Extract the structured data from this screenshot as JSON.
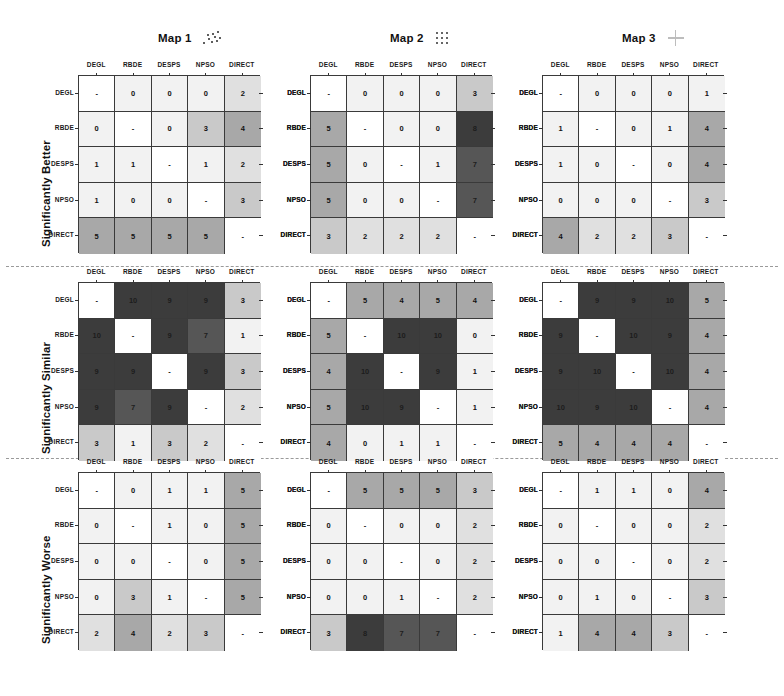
{
  "figure": {
    "labels": [
      "DEGL",
      "RBDE",
      "DESPS",
      "NPSO",
      "DIRECT"
    ],
    "band_labels": [
      "Significantly Better",
      "Significantly Similar",
      "Significantly Worse"
    ],
    "maps": [
      {
        "title": "Map 1",
        "glyph": "scatter-dots-icon"
      },
      {
        "title": "Map 2",
        "glyph": "grid-dots-icon"
      },
      {
        "title": "Map 3",
        "glyph": "cross-icon"
      }
    ],
    "diagonal_marker": "-",
    "colors": {
      "white": "#ffffff",
      "very_light": "#f2f2f2",
      "light": "#e0e0e0",
      "mid_light": "#c9c9c9",
      "mid": "#a8a8a8",
      "mid_dark": "#7d7d7d",
      "dark": "#565656",
      "very_dark": "#3c3c3c",
      "grid_line": "#3a3a3a"
    }
  },
  "chart_data": {
    "type": "heatmap",
    "xlabel": "",
    "ylabel": "",
    "categories": [
      "DEGL",
      "RBDE",
      "DESPS",
      "NPSO",
      "DIRECT"
    ],
    "row_categories": [
      "DEGL",
      "RBDE",
      "DESPS",
      "NPSO",
      "DIRECT"
    ],
    "col_categories": [
      "DEGL",
      "RBDE",
      "DESPS",
      "NPSO",
      "DIRECT"
    ],
    "value_range": [
      0,
      10
    ],
    "grid": true,
    "legend": "none",
    "diagonal": "not-applicable (shown as dash)",
    "panel_rows": [
      "Significantly Better",
      "Significantly Similar",
      "Significantly Worse"
    ],
    "panel_cols": [
      "Map 1",
      "Map 2",
      "Map 3"
    ],
    "panels": [
      {
        "row_band": "Significantly Better",
        "map": "Map 1",
        "matrix": [
          [
            "-",
            "0",
            "0",
            "0",
            "2"
          ],
          [
            "0",
            "-",
            "0",
            "3",
            "4"
          ],
          [
            "1",
            "1",
            "-",
            "1",
            "2"
          ],
          [
            "1",
            "0",
            "0",
            "-",
            "3"
          ],
          [
            "5",
            "5",
            "5",
            "5",
            "-"
          ]
        ]
      },
      {
        "row_band": "Significantly Better",
        "map": "Map 2",
        "matrix": [
          [
            "-",
            "0",
            "0",
            "0",
            "3"
          ],
          [
            "5",
            "-",
            "0",
            "0",
            "8"
          ],
          [
            "5",
            "0",
            "-",
            "1",
            "7"
          ],
          [
            "5",
            "0",
            "0",
            "-",
            "7"
          ],
          [
            "3",
            "2",
            "2",
            "2",
            "-"
          ]
        ]
      },
      {
        "row_band": "Significantly Better",
        "map": "Map 3",
        "matrix": [
          [
            "-",
            "0",
            "0",
            "0",
            "1"
          ],
          [
            "1",
            "-",
            "0",
            "1",
            "4"
          ],
          [
            "1",
            "0",
            "-",
            "0",
            "4"
          ],
          [
            "0",
            "0",
            "0",
            "-",
            "3"
          ],
          [
            "4",
            "2",
            "2",
            "3",
            "-"
          ]
        ]
      },
      {
        "row_band": "Significantly Similar",
        "map": "Map 1",
        "matrix": [
          [
            "-",
            "10",
            "9",
            "9",
            "3"
          ],
          [
            "10",
            "-",
            "9",
            "7",
            "1"
          ],
          [
            "9",
            "9",
            "-",
            "9",
            "3"
          ],
          [
            "9",
            "7",
            "9",
            "-",
            "2"
          ],
          [
            "3",
            "1",
            "3",
            "2",
            "-"
          ]
        ]
      },
      {
        "row_band": "Significantly Similar",
        "map": "Map 2",
        "matrix": [
          [
            "-",
            "5",
            "4",
            "5",
            "4"
          ],
          [
            "5",
            "-",
            "10",
            "10",
            "0"
          ],
          [
            "4",
            "10",
            "-",
            "9",
            "1"
          ],
          [
            "5",
            "10",
            "9",
            "-",
            "1"
          ],
          [
            "4",
            "0",
            "1",
            "1",
            "-"
          ]
        ]
      },
      {
        "row_band": "Significantly Similar",
        "map": "Map 3",
        "matrix": [
          [
            "-",
            "9",
            "9",
            "10",
            "5"
          ],
          [
            "9",
            "-",
            "10",
            "9",
            "4"
          ],
          [
            "9",
            "10",
            "-",
            "10",
            "4"
          ],
          [
            "10",
            "9",
            "10",
            "-",
            "4"
          ],
          [
            "5",
            "4",
            "4",
            "4",
            "-"
          ]
        ]
      },
      {
        "row_band": "Significantly Worse",
        "map": "Map 1",
        "matrix": [
          [
            "-",
            "0",
            "1",
            "1",
            "5"
          ],
          [
            "0",
            "-",
            "1",
            "0",
            "5"
          ],
          [
            "0",
            "0",
            "-",
            "0",
            "5"
          ],
          [
            "0",
            "3",
            "1",
            "-",
            "5"
          ],
          [
            "2",
            "4",
            "2",
            "3",
            "-"
          ]
        ]
      },
      {
        "row_band": "Significantly Worse",
        "map": "Map 2",
        "matrix": [
          [
            "-",
            "5",
            "5",
            "5",
            "3"
          ],
          [
            "0",
            "-",
            "0",
            "0",
            "2"
          ],
          [
            "0",
            "0",
            "-",
            "0",
            "2"
          ],
          [
            "0",
            "0",
            "1",
            "-",
            "2"
          ],
          [
            "3",
            "8",
            "7",
            "7",
            "-"
          ]
        ]
      },
      {
        "row_band": "Significantly Worse",
        "map": "Map 3",
        "matrix": [
          [
            "-",
            "1",
            "1",
            "0",
            "4"
          ],
          [
            "0",
            "-",
            "0",
            "0",
            "2"
          ],
          [
            "0",
            "0",
            "-",
            "0",
            "2"
          ],
          [
            "0",
            "1",
            "0",
            "-",
            "3"
          ],
          [
            "1",
            "4",
            "4",
            "3",
            "-"
          ]
        ]
      }
    ]
  }
}
